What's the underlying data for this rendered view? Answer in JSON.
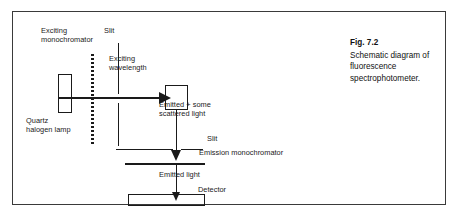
{
  "figure": {
    "caption_title": "Fig. 7.2",
    "caption_body": "Schematic diagram of fluorescence spectrophotometer.",
    "border_color": "#3a3a3a",
    "line_color": "#1a1a1a",
    "background": "#ffffff"
  },
  "labels": {
    "exciting_monochromator": "Exciting\nmonochromator",
    "slit_top": "Slit",
    "exciting_wavelength": "Exciting\nwavelength",
    "emitted_scattered": "Emitted + some\nscattered light",
    "quartz_halogen_lamp": "Quartz\nhalogen lamp",
    "slit_lower": "Slit",
    "emission_monochromator": "Emission monochromator",
    "emitted_light": "Emitted light",
    "detector": "Detector"
  },
  "components": [
    {
      "name": "quartz-halogen-lamp",
      "label": "Quartz halogen lamp",
      "shape": "rectangle"
    },
    {
      "name": "exciting-monochromator",
      "label": "Exciting monochromator",
      "shape": "dotted-vertical-line"
    },
    {
      "name": "excitation-slit",
      "label": "Slit",
      "shape": "vertical-line"
    },
    {
      "name": "sample-cell",
      "label": "",
      "shape": "square"
    },
    {
      "name": "emission-slit",
      "label": "Slit",
      "shape": "horizontal-line"
    },
    {
      "name": "emission-monochromator",
      "label": "Emission monochromator",
      "shape": "horizontal-bar"
    },
    {
      "name": "detector",
      "label": "Detector",
      "shape": "rectangle"
    }
  ],
  "beams": [
    {
      "name": "excitation-beam",
      "label": "Exciting wavelength",
      "direction": "right"
    },
    {
      "name": "emission-beam-upper",
      "label": "Emitted + some scattered light",
      "direction": "down"
    },
    {
      "name": "emission-beam-lower",
      "label": "Emitted light",
      "direction": "down"
    }
  ]
}
